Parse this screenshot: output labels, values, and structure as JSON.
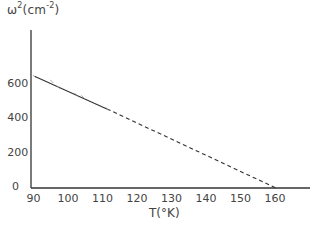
{
  "chart_data": {
    "type": "line",
    "title": "",
    "ylabel": "ω²(cm⁻²)",
    "ylabel_base": "ω",
    "ylabel_sup": "2",
    "ylabel_unit": "(cm",
    "ylabel_unit_sup": "-2",
    "ylabel_close": ")",
    "xlabel": "T(°K)",
    "xlim": [
      90,
      166
    ],
    "ylim": [
      0,
      760
    ],
    "xticks": [
      90,
      100,
      110,
      120,
      130,
      140,
      150,
      160
    ],
    "xtick_labels": [
      "90",
      "100",
      "110",
      "120",
      "130",
      "140",
      "150",
      "160"
    ],
    "yticks": [
      0,
      200,
      400,
      600
    ],
    "ytick_labels": [
      "0",
      "200",
      "400",
      "600"
    ],
    "grid": false,
    "legend": null,
    "series": [
      {
        "name": "measured",
        "style": "solid",
        "x": [
          91,
          112
        ],
        "y": [
          650,
          460
        ]
      },
      {
        "name": "extrapolation",
        "style": "dashed",
        "x": [
          112,
          161
        ],
        "y": [
          460,
          0
        ]
      }
    ],
    "points": {
      "x": [
        91,
        96,
        98,
        103,
        105,
        112
      ],
      "y": [
        648,
        620,
        585,
        545,
        530,
        462
      ]
    }
  }
}
